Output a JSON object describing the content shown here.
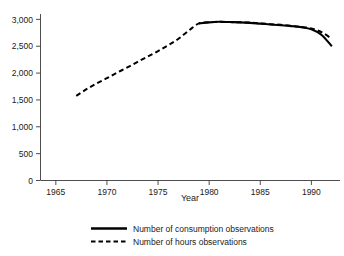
{
  "chart_data": {
    "type": "line",
    "title": "",
    "xlabel": "Year",
    "ylabel": "",
    "xlim": [
      1963.5,
      1992.8
    ],
    "ylim": [
      0,
      3100
    ],
    "grid": false,
    "legend_position": "bottom",
    "x_ticks": [
      "1965",
      "1970",
      "1975",
      "1980",
      "1985",
      "1990"
    ],
    "x_tick_values": [
      1965,
      1970,
      1975,
      1980,
      1985,
      1990
    ],
    "y_ticks": [
      "0",
      "500",
      "1,000",
      "1,500",
      "2,000",
      "2,500",
      "3,000"
    ],
    "y_tick_values": [
      0,
      500,
      1000,
      1500,
      2000,
      2500,
      3000
    ],
    "x": [
      1967,
      1968,
      1969,
      1970,
      1971,
      1972,
      1973,
      1974,
      1975,
      1976,
      1977,
      1978,
      1979,
      1980,
      1981,
      1982,
      1983,
      1984,
      1985,
      1986,
      1987,
      1988,
      1989,
      1990,
      1991,
      1992
    ],
    "series": [
      {
        "name": "Number of consumption observations",
        "style": "solid",
        "x": [
          1979,
          1980,
          1981,
          1982,
          1983,
          1984,
          1985,
          1986,
          1987,
          1988,
          1989,
          1990,
          1991,
          1992
        ],
        "values": [
          2925,
          2945,
          2955,
          2950,
          2945,
          2935,
          2920,
          2905,
          2890,
          2875,
          2855,
          2815,
          2710,
          2500
        ]
      },
      {
        "name": "Number of hours observations",
        "style": "dashed",
        "x": [
          1967,
          1968,
          1969,
          1970,
          1971,
          1972,
          1973,
          1974,
          1975,
          1976,
          1977,
          1978,
          1979,
          1980,
          1981,
          1982,
          1983,
          1984,
          1985,
          1986,
          1987,
          1988,
          1989,
          1990,
          1991,
          1992
        ],
        "values": [
          1575,
          1700,
          1810,
          1905,
          2010,
          2105,
          2210,
          2310,
          2410,
          2520,
          2640,
          2790,
          2925,
          2945,
          2955,
          2950,
          2945,
          2940,
          2925,
          2910,
          2900,
          2880,
          2860,
          2830,
          2760,
          2640
        ]
      }
    ]
  },
  "legend": {
    "items": [
      {
        "label": "Number of consumption observations",
        "style": "solid"
      },
      {
        "label": "Number of hours observations",
        "style": "dashed"
      }
    ]
  }
}
